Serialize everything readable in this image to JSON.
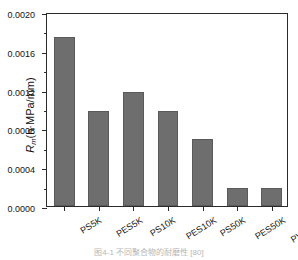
{
  "figure": {
    "caption": "图4-1 不同聚合物的耐磨性 [80]"
  },
  "chart_data": {
    "type": "bar",
    "title": "",
    "xlabel": "",
    "ylabel": "R_m(h·MPa/mm)",
    "ylabel_parts": {
      "symbol": "R",
      "subscript": "m",
      "units": "(h·MPa/mm)"
    },
    "categories": [
      "PS5K",
      "PES5K",
      "PS10K",
      "PES10K",
      "PS50K",
      "PES50K",
      "PVDF50K"
    ],
    "values": [
      0.00174,
      0.00098,
      0.00118,
      0.00098,
      0.00069,
      0.00019,
      0.00019
    ],
    "ylim": [
      0.0,
      0.002
    ],
    "ytick_labels": [
      "0.0000",
      "0.0004",
      "0.0008",
      "0.0012",
      "0.0016",
      "0.0020"
    ],
    "ytick_values": [
      0.0,
      0.0004,
      0.0008,
      0.0012,
      0.0016,
      0.002
    ],
    "minor_tick_step": 0.0002,
    "grid": false,
    "legend": null,
    "bar_color": "#6e6e6e",
    "axis_color": "#2b2b2b",
    "background": "#ffffff"
  }
}
